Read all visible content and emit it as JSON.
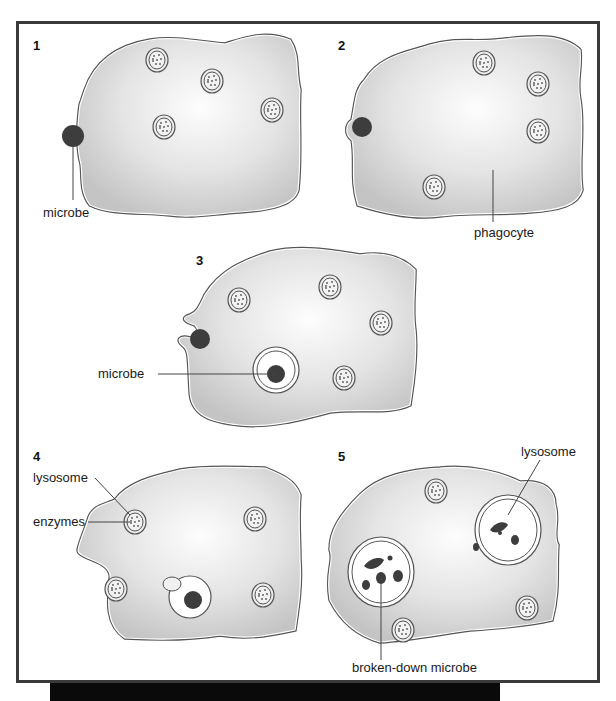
{
  "diagram": {
    "colors": {
      "cell_fill_edge": "#c8c8c8",
      "cell_fill_center": "#fafafa",
      "outline": "#555555",
      "microbe": "#3d3d3d",
      "frame": "#3a3a3a",
      "bottom_bar": "#0a0a0a"
    },
    "panels": [
      {
        "number": "1",
        "labels": [
          "microbe"
        ]
      },
      {
        "number": "2",
        "labels": [
          "phagocyte"
        ]
      },
      {
        "number": "3",
        "labels": [
          "microbe"
        ]
      },
      {
        "number": "4",
        "labels": [
          "lysosome",
          "enzymes"
        ]
      },
      {
        "number": "5",
        "labels": [
          "lysosome",
          "broken-down microbe"
        ]
      }
    ]
  }
}
